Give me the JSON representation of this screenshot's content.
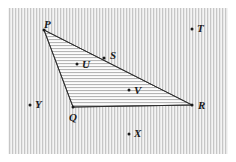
{
  "figure": {
    "canvas": {
      "width": 236,
      "height": 162
    },
    "colors": {
      "ink": "#1a1a1a",
      "stroke": "#2b2b2b",
      "background_fill": "#f2f2f2",
      "background_stripe": "#c8c8c8",
      "interior_fill": "#fbfbfb",
      "interior_stripe": "#b9b9b9",
      "paper": "#ffffff"
    },
    "background": {
      "name": "vertical-hatch-field",
      "pattern": "vertical-stripes",
      "period_px": 3,
      "rect": {
        "x": 8,
        "y": 8,
        "width": 220,
        "height": 146
      }
    },
    "shape": {
      "name": "triangle-pqr",
      "fill_pattern": "horizontal-stripes",
      "period_px": 3,
      "vertices": [
        {
          "label": "P",
          "x": 44,
          "y": 30
        },
        {
          "label": "R",
          "x": 192,
          "y": 105
        },
        {
          "label": "Q",
          "x": 73,
          "y": 107
        }
      ]
    },
    "points": [
      {
        "label": "P",
        "x": 44,
        "y": 30,
        "lx": 44,
        "ly": 19,
        "role": "vertex",
        "dot": true
      },
      {
        "label": "S",
        "x": 104,
        "y": 58,
        "lx": 110,
        "ly": 50,
        "role": "on-edge",
        "dot": true
      },
      {
        "label": "U",
        "x": 77,
        "y": 64,
        "lx": 82,
        "ly": 59,
        "role": "interior",
        "dot": true
      },
      {
        "label": "V",
        "x": 129,
        "y": 90,
        "lx": 134,
        "ly": 85,
        "role": "interior",
        "dot": true
      },
      {
        "label": "R",
        "x": 192,
        "y": 105,
        "lx": 198,
        "ly": 100,
        "role": "vertex",
        "dot": true
      },
      {
        "label": "Q",
        "x": 73,
        "y": 107,
        "lx": 69,
        "ly": 112,
        "role": "vertex",
        "dot": true
      },
      {
        "label": "T",
        "x": 192,
        "y": 29,
        "lx": 197,
        "ly": 23,
        "role": "exterior",
        "dot": true
      },
      {
        "label": "X",
        "x": 129,
        "y": 134,
        "lx": 134,
        "ly": 128,
        "role": "exterior",
        "dot": true
      },
      {
        "label": "Y",
        "x": 30,
        "y": 105,
        "lx": 35,
        "ly": 99,
        "role": "exterior",
        "dot": true
      }
    ],
    "edges": [
      {
        "name": "edge-pr",
        "from": "P",
        "to": "R"
      },
      {
        "name": "edge-pq",
        "from": "P",
        "to": "Q"
      },
      {
        "name": "edge-qr",
        "from": "Q",
        "to": "R"
      }
    ]
  }
}
